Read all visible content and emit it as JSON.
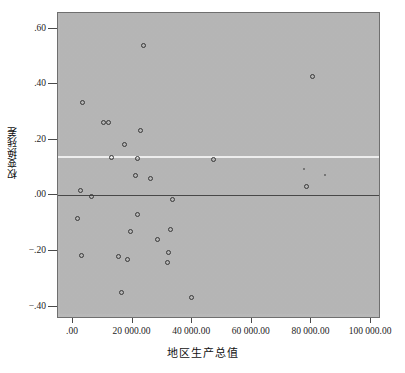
{
  "chart_data": {
    "type": "scatter",
    "title": "",
    "xlabel": "地区生产总值",
    "ylabel": "权变换残差",
    "xlim": [
      -5000,
      105000
    ],
    "ylim": [
      -0.47,
      0.685
    ],
    "grid": false,
    "legend": "none",
    "x_ticks": [
      {
        "value": 0,
        "label": ".00"
      },
      {
        "value": 20000,
        "label": "20 000.00"
      },
      {
        "value": 40000,
        "label": "40 000.00"
      },
      {
        "value": 60000,
        "label": "60 000.00"
      },
      {
        "value": 80000,
        "label": "80 000.00"
      },
      {
        "value": 100000,
        "label": "100 000.00"
      }
    ],
    "y_ticks": [
      {
        "value": 0.6,
        "label": ".60"
      },
      {
        "value": 0.4,
        "label": ".40"
      },
      {
        "value": 0.2,
        "label": ".20"
      },
      {
        "value": 0.0,
        "label": ".00"
      },
      {
        "value": -0.2,
        "label": "−.20"
      },
      {
        "value": -0.4,
        "label": "−.40"
      }
    ],
    "reference_lines": [
      {
        "name": "zero-line",
        "orientation": "horizontal",
        "y": 0.0,
        "color": "#4a4a4a"
      },
      {
        "name": "fit-line",
        "orientation": "horizontal",
        "y": 0.14,
        "color": "#f2f2f2"
      }
    ],
    "marker": {
      "shape": "open-circle",
      "color": "#3b3b3b",
      "size": 5
    },
    "points": [
      {
        "x": 23500,
        "y": 0.54,
        "size": "normal"
      },
      {
        "x": 80500,
        "y": 0.428,
        "size": "normal"
      },
      {
        "x": 3200,
        "y": 0.333,
        "size": "normal"
      },
      {
        "x": 10200,
        "y": 0.263,
        "size": "normal"
      },
      {
        "x": 11800,
        "y": 0.264,
        "size": "normal"
      },
      {
        "x": 22600,
        "y": 0.232,
        "size": "normal"
      },
      {
        "x": 17400,
        "y": 0.184,
        "size": "normal"
      },
      {
        "x": 13000,
        "y": 0.138,
        "size": "normal"
      },
      {
        "x": 21500,
        "y": 0.131,
        "size": "normal"
      },
      {
        "x": 47000,
        "y": 0.13,
        "size": "normal"
      },
      {
        "x": 21000,
        "y": 0.07,
        "size": "normal"
      },
      {
        "x": 26000,
        "y": 0.061,
        "size": "normal"
      },
      {
        "x": 84500,
        "y": 0.072,
        "size": "tiny"
      },
      {
        "x": 77500,
        "y": 0.095,
        "size": "tiny"
      },
      {
        "x": 78500,
        "y": 0.033,
        "size": "normal"
      },
      {
        "x": 2400,
        "y": 0.019,
        "size": "normal"
      },
      {
        "x": 6300,
        "y": -0.004,
        "size": "normal"
      },
      {
        "x": 33500,
        "y": -0.014,
        "size": "normal"
      },
      {
        "x": 1600,
        "y": -0.082,
        "size": "normal"
      },
      {
        "x": 21800,
        "y": -0.067,
        "size": "normal"
      },
      {
        "x": 19400,
        "y": -0.13,
        "size": "normal"
      },
      {
        "x": 32800,
        "y": -0.124,
        "size": "normal"
      },
      {
        "x": 28400,
        "y": -0.158,
        "size": "normal"
      },
      {
        "x": 32200,
        "y": -0.204,
        "size": "normal"
      },
      {
        "x": 2700,
        "y": -0.217,
        "size": "normal"
      },
      {
        "x": 15200,
        "y": -0.221,
        "size": "normal"
      },
      {
        "x": 18200,
        "y": -0.232,
        "size": "normal"
      },
      {
        "x": 31600,
        "y": -0.243,
        "size": "normal"
      },
      {
        "x": 16400,
        "y": -0.35,
        "size": "normal"
      },
      {
        "x": 39800,
        "y": -0.367,
        "size": "normal"
      }
    ]
  },
  "axes": {
    "y_title": "权变换残差",
    "x_title": "地区生产总值"
  }
}
